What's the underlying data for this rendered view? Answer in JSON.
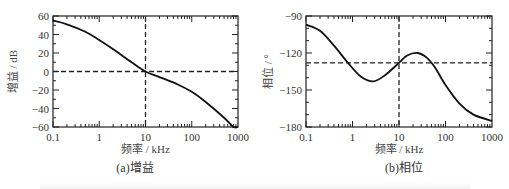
{
  "chart_data": [
    {
      "type": "line",
      "panel": "a",
      "caption": "(a)增益",
      "xlabel": "频率 / kHz",
      "ylabel": "增益 / dB",
      "xscale": "log",
      "xlim": [
        0.1,
        1000
      ],
      "ylim": [
        -60,
        60
      ],
      "xticks": [
        0.1,
        1,
        10,
        100,
        1000
      ],
      "xtick_labels": [
        "0.1",
        "1",
        "10",
        "100",
        "1000"
      ],
      "yticks": [
        60,
        40,
        20,
        0,
        -20,
        -40,
        -60
      ],
      "ytick_labels": [
        "60",
        "40",
        "20",
        "0",
        "−20",
        "−40",
        "−60"
      ],
      "grid": false,
      "reference_lines": {
        "horizontal_dashed": 0,
        "vertical_dashed": 10
      },
      "series": [
        {
          "name": "gain",
          "x": [
            0.1,
            0.2,
            0.5,
            1,
            2,
            5,
            10,
            20,
            50,
            100,
            200,
            500,
            800,
            1000
          ],
          "values": [
            55,
            51,
            43,
            34,
            24,
            10,
            0,
            -6,
            -14,
            -22,
            -33,
            -50,
            -60,
            -60
          ]
        }
      ]
    },
    {
      "type": "line",
      "panel": "b",
      "caption": "(b)相位",
      "xlabel": "频率 / kHz",
      "ylabel": "相位 / °",
      "xscale": "log",
      "xlim": [
        0.1,
        1000
      ],
      "ylim": [
        -180,
        -90
      ],
      "xticks": [
        0.1,
        1,
        10,
        100,
        1000
      ],
      "xtick_labels": [
        "0.1",
        "1",
        "10",
        "100",
        "1000"
      ],
      "yticks": [
        -90,
        -120,
        -150,
        -180
      ],
      "ytick_labels": [
        "−90",
        "−120",
        "−150",
        "−180"
      ],
      "grid": false,
      "reference_lines": {
        "horizontal_dashed": -128,
        "vertical_dashed": 10
      },
      "series": [
        {
          "name": "phase",
          "x": [
            0.1,
            0.2,
            0.4,
            0.8,
            1.5,
            2.8,
            5,
            10,
            15,
            25,
            40,
            60,
            100,
            200,
            400,
            1000
          ],
          "values": [
            -97,
            -102,
            -114,
            -128,
            -139,
            -143,
            -138,
            -128,
            -122,
            -120,
            -124,
            -132,
            -146,
            -161,
            -170,
            -175
          ]
        }
      ]
    }
  ],
  "panels": {
    "a": {
      "caption": "(a)增益",
      "xlabel": "频率 / kHz",
      "ylabel": "增益 / dB"
    },
    "b": {
      "caption": "(b)相位",
      "xlabel": "频率 / kHz",
      "ylabel": "相位 / °"
    }
  }
}
